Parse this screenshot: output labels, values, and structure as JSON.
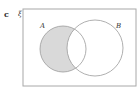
{
  "figure": {
    "part_label": "c",
    "universal_label": "ξ",
    "set_a_label": "A",
    "set_b_label": "B",
    "shaded_region": "A ∩ B'",
    "colors": {
      "shade": "#d9d9d9",
      "outline": "#9a9a9a",
      "frame": "#a8a8a8"
    }
  }
}
